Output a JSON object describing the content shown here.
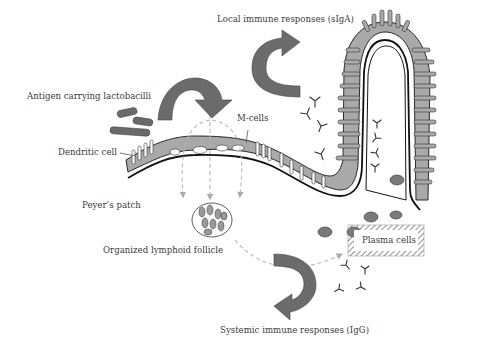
{
  "diagram": {
    "type": "biological-illustration",
    "labels": {
      "local_response": "Local immune responses (sIgA)",
      "antigen_lactobacilli": "Antigen carrying lactobacilli",
      "m_cells": "M-cells",
      "dendritic_cell": "Dendritic cell",
      "peyers_patch": "Peyer’s patch",
      "lymphoid_follicle": "Organized lymphoid follicle",
      "plasma_cells": "Plasma cells",
      "systemic_response": "Systemic immune responses (IgG)"
    },
    "colors": {
      "arrow_fill": "#6b6b6b",
      "epithelium_fill": "#a9a9a9",
      "outline": "#1e1e1e",
      "dashed_path": "#b8b8b8",
      "text": "#3a3a3a",
      "background": "#ffffff"
    }
  }
}
